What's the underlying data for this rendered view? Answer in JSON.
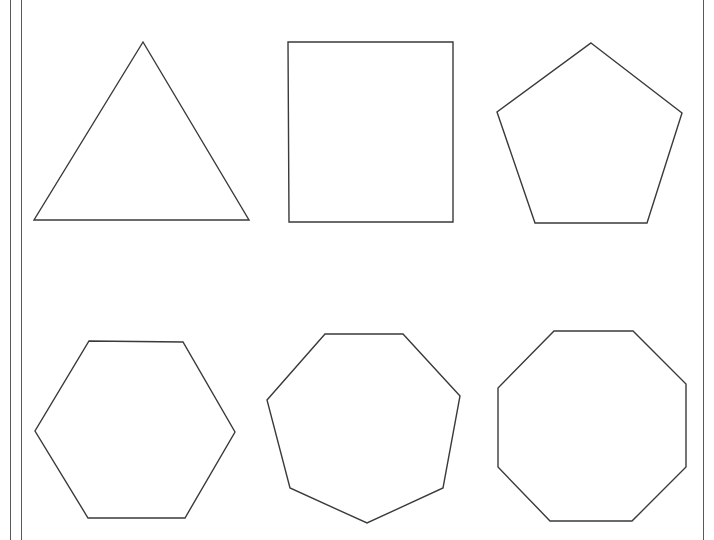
{
  "page": {
    "background": "#ffffff",
    "stroke_color": "#3a3a3a",
    "border_color": "#5a5a5a"
  },
  "borders": [
    {
      "name": "left-border-outer",
      "x": 10
    },
    {
      "name": "left-border-inner",
      "x": 21
    },
    {
      "name": "right-border",
      "x": 703
    }
  ],
  "shapes": [
    {
      "name": "triangle",
      "sides": 3,
      "points": "143,42 249,220 34,220"
    },
    {
      "name": "square",
      "sides": 4,
      "points": "288,42 453,42 453,222 289,222"
    },
    {
      "name": "pentagon",
      "sides": 5,
      "points": "591,43 682,113 647,223 535,223 497,112"
    },
    {
      "name": "hexagon",
      "sides": 6,
      "points": "89,341 183,342 235,432 185,518 88,518 35,431"
    },
    {
      "name": "heptagon",
      "sides": 7,
      "points": "325,334 403,334 460,396 443,488 367,523 290,488 267,400"
    },
    {
      "name": "octagon",
      "sides": 8,
      "points": "554,331 633,331 686,384 686,467 632,521 550,521 498,467 498,388"
    }
  ]
}
